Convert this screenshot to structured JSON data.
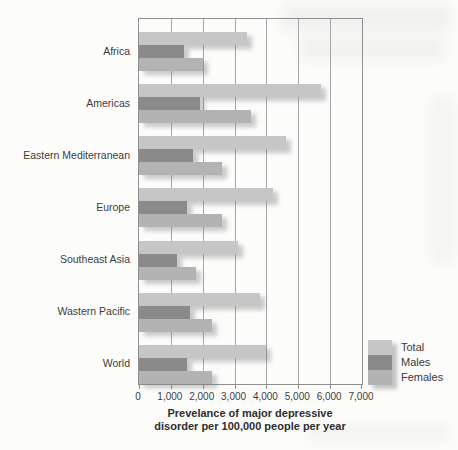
{
  "figure": {
    "background_color": "#fcfcfb",
    "text_color": "#3a3a3a"
  },
  "chart_data": {
    "type": "bar",
    "orientation": "horizontal",
    "title": "",
    "xlabel_lines": [
      "Prevelance of major depressive",
      "disorder per 100,000 people per year"
    ],
    "ylabel": "",
    "xlim": [
      0,
      7000
    ],
    "grid": true,
    "legend_position": "inside lower right",
    "categories": [
      "Africa",
      "Americas",
      "Eastern Mediterranean",
      "Europe",
      "Southeast Asia",
      "Wastern Pacific",
      "World"
    ],
    "series": [
      {
        "name": "Total",
        "color": "#c6c6c6",
        "values": [
          3400,
          5700,
          4600,
          4200,
          3100,
          3800,
          4000
        ]
      },
      {
        "name": "Males",
        "color": "#8a8a8a",
        "values": [
          1400,
          1900,
          1700,
          1500,
          1200,
          1600,
          1500
        ]
      },
      {
        "name": "Females",
        "color": "#b3b3b3",
        "values": [
          2000,
          3500,
          2600,
          2600,
          1800,
          2300,
          2300
        ]
      }
    ],
    "x_ticks": [
      0,
      1000,
      2000,
      3000,
      4000,
      5000,
      6000,
      7000
    ],
    "x_tick_labels": [
      "0",
      "1,000",
      "2,000",
      "3,000",
      "4,000",
      "5,000",
      "6,000",
      "7,000"
    ]
  }
}
